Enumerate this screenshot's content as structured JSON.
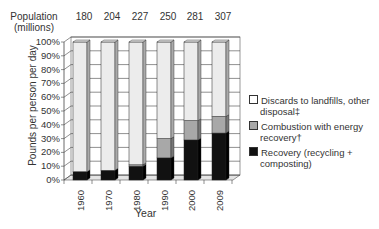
{
  "header": {
    "population_label_line1": "Population",
    "population_label_line2": "(millions)",
    "population": [
      "180",
      "204",
      "227",
      "250",
      "281",
      "307"
    ]
  },
  "yaxis": {
    "title": "Pounds per person per day",
    "ticks": [
      "100%",
      "90%",
      "80%",
      "70%",
      "60%",
      "50%",
      "40%",
      "30%",
      "20%",
      "10%",
      "0%"
    ]
  },
  "xaxis": {
    "title": "Year",
    "ticks": [
      "1960",
      "1970",
      "1980",
      "1990",
      "2000",
      "2009"
    ]
  },
  "legend": {
    "discards_1": "Discards to landfills, other",
    "discards_2": "disposal‡",
    "combustion_1": "Combustion with energy",
    "combustion_2": "recovery†",
    "recovery_1": "Recovery (recycling +",
    "recovery_2": "composting)"
  },
  "colors": {
    "discards": "#ececec",
    "combustion": "#a8a8a8",
    "recovery": "#111111"
  },
  "chart_data": {
    "type": "bar",
    "stacked": true,
    "title": "",
    "xlabel": "Year",
    "ylabel": "Pounds per person per day",
    "ylim": [
      0,
      100
    ],
    "grid": true,
    "legend_position": "right",
    "categories": [
      "1960",
      "1970",
      "1980",
      "1990",
      "2000",
      "2009"
    ],
    "population_millions": [
      180,
      204,
      227,
      250,
      281,
      307
    ],
    "series": [
      {
        "name": "Recovery (recycling + composting)",
        "values": [
          6,
          7,
          10,
          16,
          29,
          34
        ]
      },
      {
        "name": "Combustion with energy recovery†",
        "values": [
          0,
          0,
          1,
          14,
          14,
          12
        ]
      },
      {
        "name": "Discards to landfills, other disposal‡",
        "values": [
          94,
          93,
          89,
          70,
          57,
          54
        ]
      }
    ]
  }
}
